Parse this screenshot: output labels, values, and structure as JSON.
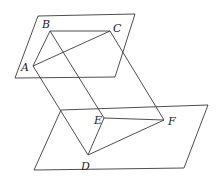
{
  "diagram": {
    "type": "geometry-3d",
    "stroke_color": "#3a3a3a",
    "label_color": "#222222",
    "planes": [
      {
        "name": "upper-plane",
        "points": [
          [
            38,
            16
          ],
          [
            135,
            14
          ],
          [
            115,
            77
          ],
          [
            15,
            78
          ]
        ]
      },
      {
        "name": "lower-plane",
        "points": [
          [
            61,
            110
          ],
          [
            208,
            105
          ],
          [
            184,
            168
          ],
          [
            34,
            170
          ]
        ]
      }
    ],
    "points": {
      "A": {
        "x": 33,
        "y": 66,
        "label": "A",
        "label_x": 21,
        "label_y": 71
      },
      "B": {
        "x": 50,
        "y": 31,
        "label": "B",
        "label_x": 42,
        "label_y": 28
      },
      "C": {
        "x": 110,
        "y": 31,
        "label": "C",
        "label_x": 113,
        "label_y": 32
      },
      "D": {
        "x": 88,
        "y": 155,
        "label": "D",
        "label_x": 81,
        "label_y": 170
      },
      "E": {
        "x": 104,
        "y": 118,
        "label": "E",
        "label_x": 94,
        "label_y": 124
      },
      "F": {
        "x": 164,
        "y": 120,
        "label": "F",
        "label_x": 168,
        "label_y": 125
      }
    },
    "segments": [
      [
        "A",
        "B"
      ],
      [
        "B",
        "C"
      ],
      [
        "A",
        "C"
      ],
      [
        "D",
        "E"
      ],
      [
        "E",
        "F"
      ],
      [
        "D",
        "F"
      ],
      [
        "A",
        "D"
      ],
      [
        "B",
        "E"
      ],
      [
        "C",
        "F"
      ]
    ]
  }
}
